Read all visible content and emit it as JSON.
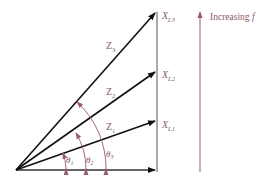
{
  "diagram": {
    "colors": {
      "vector": "#111111",
      "axis": "#555555",
      "annotation": "#9b5a66",
      "label": "#8a5a63"
    },
    "vectors": [
      {
        "id": "Z1",
        "label_main": "Z",
        "label_sub": "1",
        "reactance_main": "X",
        "reactance_sub": "L1"
      },
      {
        "id": "Z2",
        "label_main": "Z",
        "label_sub": "2",
        "reactance_main": "X",
        "reactance_sub": "L2"
      },
      {
        "id": "Z3",
        "label_main": "Z",
        "label_sub": "3",
        "reactance_main": "X",
        "reactance_sub": "L3"
      }
    ],
    "angles": [
      {
        "main": "θ",
        "sub": "1"
      },
      {
        "main": "θ",
        "sub": "2"
      },
      {
        "main": "θ",
        "sub": "3"
      }
    ],
    "frequency_arrow": {
      "label": "Increasing ",
      "variable": "f"
    }
  }
}
